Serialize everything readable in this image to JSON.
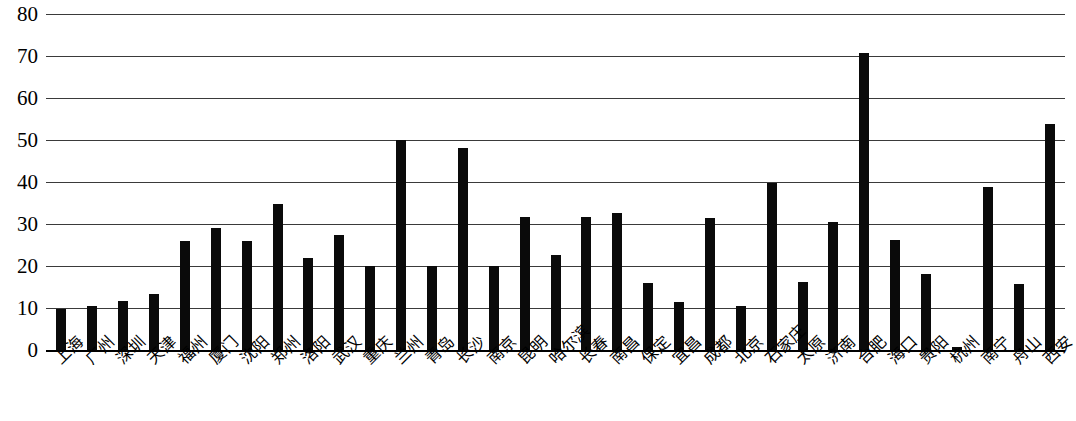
{
  "chart_data": {
    "type": "bar",
    "title": "",
    "subtitle": "",
    "xlabel": "",
    "ylabel": "",
    "ylim": [
      0,
      80
    ],
    "ytick_step": 10,
    "yticks": [
      80,
      70,
      60,
      50,
      40,
      30,
      20,
      10,
      0
    ],
    "grid": true,
    "legend": false,
    "legend_position": "none",
    "bar_color": "#0a0a0a",
    "gridline_color": "#3a3a3a",
    "axis_color": "#000000",
    "background_color": "#ffffff",
    "xtick_rotation_degrees": -45,
    "categories": [
      "上海",
      "广州",
      "深圳",
      "天津",
      "福州",
      "厦门",
      "沈阳",
      "郑州",
      "洛阳",
      "武汉",
      "重庆",
      "兰州",
      "青岛",
      "长沙",
      "南京",
      "昆明",
      "哈尔滨",
      "长春",
      "南昌",
      "保定",
      "宜昌",
      "成都",
      "北京",
      "石家庄",
      "太原",
      "济南",
      "合肥",
      "海口",
      "贵阳",
      "杭州",
      "南宁",
      "舟山",
      "西安"
    ],
    "values": [
      9.8,
      10.4,
      11.6,
      13.4,
      26.0,
      29.0,
      26.0,
      34.8,
      21.8,
      27.5,
      20.0,
      50.0,
      20.0,
      48.2,
      20.0,
      31.7,
      22.7,
      31.6,
      32.6,
      16.0,
      11.4,
      31.5,
      10.5,
      39.7,
      16.3,
      30.5,
      70.8,
      26.1,
      18.0,
      0.7,
      38.8,
      15.6,
      53.8
    ]
  }
}
